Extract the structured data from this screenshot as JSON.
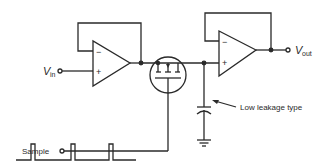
{
  "diagram": {
    "labels": {
      "vin_main": "V",
      "vin_sub": "in",
      "vout_main": "V",
      "vout_sub": "out",
      "sample": "Sample",
      "capacitor_note": "Low leakage type"
    },
    "opamp1": {
      "minus": "−",
      "plus": "+"
    },
    "opamp2": {
      "minus": "−",
      "plus": "+"
    },
    "components": [
      "input buffer op-amp",
      "MOSFET switch",
      "hold capacitor",
      "output buffer op-amp",
      "ground"
    ],
    "waveform": {
      "pulses": 3
    },
    "colors": {
      "line": "#2a2a2a",
      "background": "#ffffff"
    }
  }
}
